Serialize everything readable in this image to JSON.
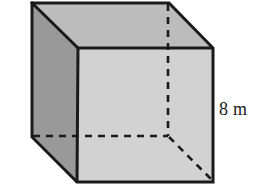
{
  "figure": {
    "name": "cube",
    "shape_name": "cube",
    "background_color": "#ffffff",
    "edge_color": "#1a1a1a",
    "faces": {
      "top": {
        "name": "top-face",
        "fill": "#bcbcbc"
      },
      "front": {
        "name": "front-face",
        "fill": "#d2d2d2"
      },
      "left": {
        "name": "left-face",
        "fill": "#999999"
      }
    },
    "hidden_edges": {
      "style": "dashed",
      "color": "#1a1a1a",
      "count": 3
    },
    "labels": {
      "height": "8 m"
    },
    "vertices": {
      "back_top_left": "32,3",
      "back_top_right": "169,3",
      "front_top_left": "78,48",
      "front_top_right": "213,48",
      "back_bottom_left": "32,137",
      "back_bottom_hidden": "168,136",
      "front_bottom_left": "77,182",
      "front_bottom_right": "213,182"
    }
  }
}
